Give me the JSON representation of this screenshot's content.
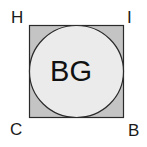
{
  "diagram": {
    "vertices": {
      "top_left": "H",
      "top_right": "I",
      "bottom_left": "C",
      "bottom_right": "B"
    },
    "circle_label": "BG",
    "colors": {
      "square_fill": "#c4c4c4",
      "circle_fill": "#ebebeb",
      "stroke": "#2a2a2a"
    }
  }
}
